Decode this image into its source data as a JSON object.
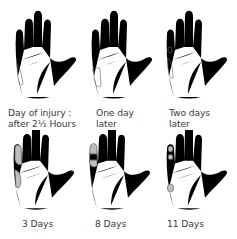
{
  "figure": {
    "type": "sequence-of-hand-illustrations",
    "layout": {
      "rows": 2,
      "columns": 3
    },
    "panels": [
      {
        "caption_line1": "Day of injury :",
        "caption_line2": "after 2½ Hours",
        "stage": "day-of-injury"
      },
      {
        "caption_line1": "One day",
        "caption_line2": "later",
        "stage": "one-day"
      },
      {
        "caption_line1": "Two days",
        "caption_line2": "later",
        "stage": "two-days"
      },
      {
        "caption_line1": "3 Days",
        "caption_line2": "",
        "stage": "three-days"
      },
      {
        "caption_line1": "8 Days",
        "caption_line2": "",
        "stage": "eight-days"
      },
      {
        "caption_line1": "11 Days",
        "caption_line2": "",
        "stage": "eleven-days"
      }
    ],
    "colors": {
      "line": "#555555",
      "lesion_fill": "#bdbdbd",
      "background": "#ffffff",
      "text": "#3a3a3a"
    }
  }
}
